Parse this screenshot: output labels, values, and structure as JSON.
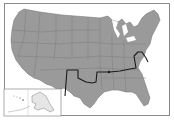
{
  "map": {
    "title": "",
    "region": "United States",
    "style": "grayscale",
    "colors": {
      "land": "#9a9a9a",
      "state_border": "#7c7c7c",
      "route": "#1a1a1a",
      "inset_land": "#e6e6e6",
      "frame": "#8a8a8a",
      "background": "#ffffff"
    },
    "route": {
      "description": "dark highlighted line across southern-central and eastern states",
      "marker": "dot near Tennessee/Kentucky"
    },
    "inset": {
      "label": "",
      "contents": [
        "Alaska",
        "Hawaii"
      ]
    }
  }
}
